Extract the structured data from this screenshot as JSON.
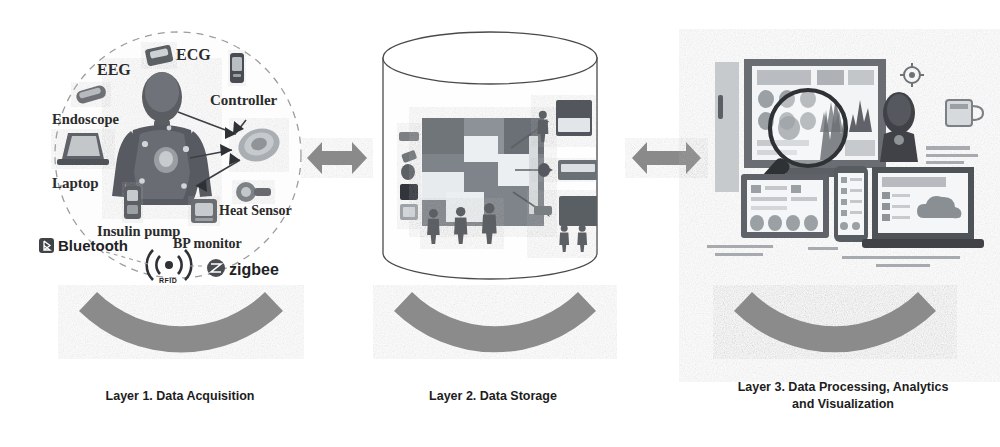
{
  "figure": {
    "background_color": "#ffffff",
    "band_color": "#8b8b8b",
    "arrow_color": "#8a8a8a",
    "ink_color": "#2b2b2b"
  },
  "layers": [
    {
      "id": "layer1",
      "caption_line1": "Layer 1. Data Acquisition",
      "caption_line2": "",
      "device_labels": [
        {
          "name": "eeg",
          "text": "EEG"
        },
        {
          "name": "ecg",
          "text": "ECG"
        },
        {
          "name": "controller",
          "text": "Controller"
        },
        {
          "name": "endoscope",
          "text": "Endoscope"
        },
        {
          "name": "laptop",
          "text": "Laptop"
        },
        {
          "name": "heat-sensor",
          "text": "Heat Sensor"
        },
        {
          "name": "insulin-pump",
          "text": "Insulin pump"
        },
        {
          "name": "bp-monitor",
          "text": "BP monitor"
        }
      ],
      "protocol_labels": [
        {
          "name": "bluetooth",
          "text": "Bluetooth"
        },
        {
          "name": "rfid",
          "text": "RFID"
        },
        {
          "name": "zigbee",
          "text": "zigbee"
        }
      ]
    },
    {
      "id": "layer2",
      "caption_line1": "Layer 2. Data Storage",
      "caption_line2": "",
      "device_labels": [],
      "protocol_labels": []
    },
    {
      "id": "layer3",
      "caption_line1": "Layer 3. Data Processing, Analytics",
      "caption_line2": "and Visualization",
      "device_labels": [],
      "protocol_labels": []
    }
  ],
  "connectors": [
    {
      "name": "connector-layer1-layer2",
      "type": "double-arrow"
    },
    {
      "name": "connector-layer2-layer3",
      "type": "double-arrow"
    }
  ],
  "icons": {
    "magnifier": "magnifier-icon",
    "cylinder": "database-cylinder-icon",
    "body": "human-body-icon",
    "dashed_circle": "dashed-circle-boundary",
    "arc_band": "arc-band-shape"
  }
}
